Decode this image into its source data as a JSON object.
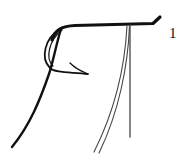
{
  "figure": {
    "label": "1",
    "stroke_color": "#111111",
    "thin_stroke_color": "#444444",
    "background": "#ffffff"
  }
}
